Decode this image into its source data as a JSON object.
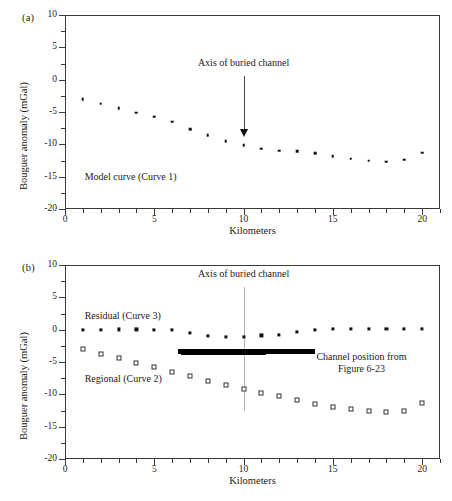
{
  "figure": {
    "panels": [
      {
        "tag": "(a)",
        "annotation": "Axis of buried channel",
        "curve_label": "Model curve (Curve 1)"
      },
      {
        "tag": "(b)",
        "annotation": "Axis of buried channel",
        "residual_label": "Residual (Curve 3)",
        "regional_label": "Regional (Curve 2)",
        "channel_label_line1": "Channel position from",
        "channel_label_line2": "Figure 6-23"
      }
    ]
  },
  "axes": {
    "xlabel": "Kilometers",
    "ylabel": "Bouguer anomaly (mGal)",
    "xticks": [
      "0",
      "5",
      "10",
      "15",
      "20"
    ],
    "xtick_values": [
      0,
      5,
      10,
      15,
      20
    ],
    "yticks": [
      "10",
      "5",
      "0",
      "-5",
      "-10",
      "-15",
      "-20"
    ],
    "ytick_values": [
      10,
      5,
      0,
      -5,
      -10,
      -15,
      -20
    ],
    "xlim": [
      0,
      21
    ],
    "ylim": [
      -20,
      10
    ]
  },
  "chart_data": [
    {
      "type": "scatter",
      "panel": "(a)",
      "title": "",
      "xlabel": "Kilometers",
      "ylabel": "Bouguer anomaly (mGal)",
      "xlim": [
        0,
        21
      ],
      "ylim": [
        -20,
        10
      ],
      "grid": false,
      "legend": "none",
      "annotations": [
        {
          "text": "Axis of buried channel",
          "x": 10,
          "y": 1.0,
          "arrow_to_y": -8.5
        },
        {
          "text": "Model curve (Curve 1)",
          "x": 2.2,
          "y": -15.2
        }
      ],
      "series": [
        {
          "name": "Model curve (Curve 1)",
          "marker": "filled-dot",
          "x": [
            1,
            2,
            3,
            4,
            5,
            6,
            7,
            8,
            9,
            10,
            11,
            12,
            13,
            14,
            15,
            16,
            17,
            18,
            19,
            20
          ],
          "values": [
            -3.0,
            -3.7,
            -4.4,
            -5.1,
            -5.7,
            -6.5,
            -7.7,
            -8.6,
            -9.5,
            -10.1,
            -10.7,
            -11.0,
            -11.1,
            -11.4,
            -11.8,
            -12.2,
            -12.5,
            -12.7,
            -12.4,
            -11.3
          ]
        }
      ]
    },
    {
      "type": "scatter",
      "panel": "(b)",
      "title": "",
      "xlabel": "Kilometers",
      "ylabel": "Bouguer anomaly (mGal)",
      "xlim": [
        0,
        21
      ],
      "ylim": [
        -20,
        10
      ],
      "grid": false,
      "legend": "inline-labels",
      "annotations": [
        {
          "text": "Axis of buried channel",
          "x": 10,
          "y": 7.5,
          "line_to_y": -12.5
        },
        {
          "text": "Residual (Curve 3)",
          "x": 2.0,
          "y": 2.0
        },
        {
          "text": "Regional (Curve 2)",
          "x": 2.0,
          "y": -7.8
        },
        {
          "text": "Channel position from",
          "x": 15.2,
          "y": -5.0
        },
        {
          "text": "Figure 6-23",
          "x": 15.2,
          "y": -6.2
        }
      ],
      "channel_bar": {
        "x_start": 6.3,
        "x_end": 14.0,
        "y": -3.4
      },
      "series": [
        {
          "name": "Residual (Curve 3)",
          "marker": "filled-square",
          "x": [
            1,
            2,
            3,
            4,
            5,
            6,
            7,
            8,
            9,
            10,
            11,
            12,
            13,
            14,
            15,
            16,
            17,
            18,
            19,
            20
          ],
          "values": [
            0.0,
            0.0,
            0.05,
            0.05,
            0.0,
            -0.05,
            -0.5,
            -1.0,
            -1.1,
            -1.1,
            -0.9,
            -0.75,
            -0.3,
            0.0,
            0.1,
            0.1,
            0.1,
            0.1,
            0.1,
            0.1
          ]
        },
        {
          "name": "Regional (Curve 2)",
          "marker": "open-square",
          "x": [
            1,
            2,
            3,
            4,
            5,
            6,
            7,
            8,
            9,
            10,
            11,
            12,
            13,
            14,
            15,
            16,
            17,
            18,
            19,
            20
          ],
          "values": [
            -3.0,
            -3.7,
            -4.4,
            -5.1,
            -5.7,
            -6.5,
            -7.2,
            -7.9,
            -8.6,
            -9.1,
            -9.8,
            -10.3,
            -10.9,
            -11.5,
            -11.9,
            -12.3,
            -12.6,
            -12.8,
            -12.5,
            -11.3
          ]
        }
      ]
    }
  ]
}
